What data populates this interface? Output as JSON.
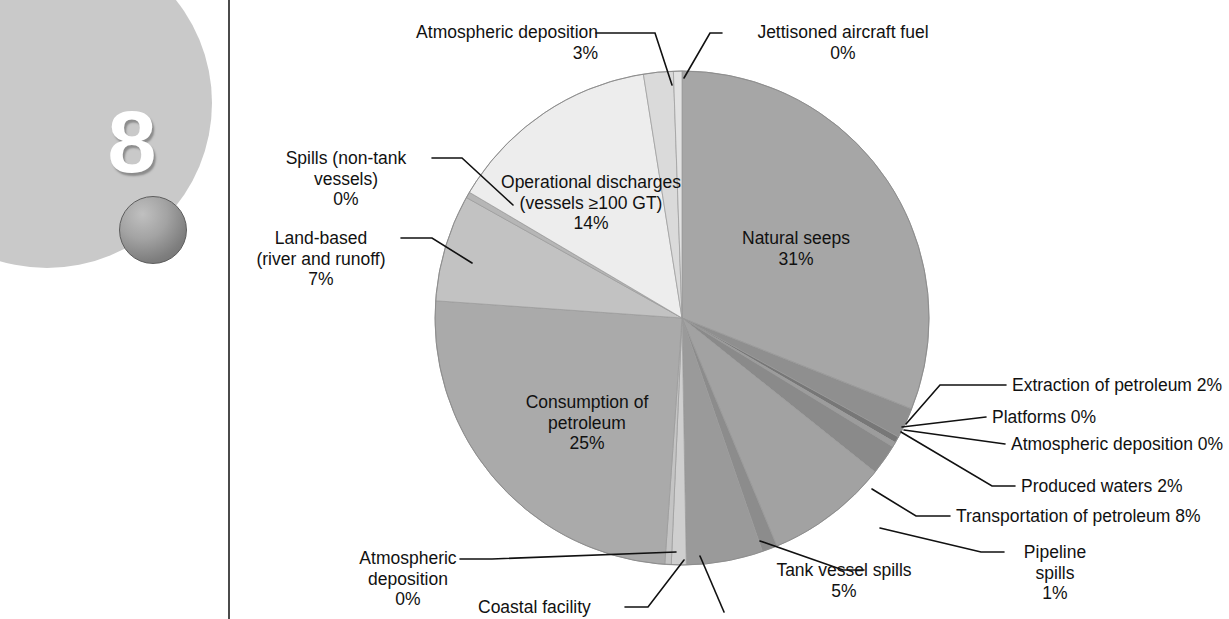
{
  "page": {
    "chapter_number": "8",
    "decoration": {
      "disc_color": "#c9c9c9",
      "ball_color": "#8e8e8e",
      "rule_color": "#4b4b4b"
    }
  },
  "chart_data": {
    "type": "pie",
    "title": "",
    "subtitle": "",
    "xlabel": "",
    "ylabel": "",
    "legend_position": "callouts",
    "grid": false,
    "units": "percent",
    "total": 100,
    "categories": [
      "Natural seeps",
      "Extraction of petroleum",
      "Platforms",
      "Atmospheric deposition (extraction)",
      "Produced waters",
      "Transportation of petroleum",
      "Pipeline spills",
      "Tank vessel spills",
      "Coastal facility spills",
      "Atmospheric deposition (transportation)",
      "Consumption of petroleum",
      "Land-based (river and runoff)",
      "Spills (non-tank vessels)",
      "Operational discharges (vessels ≥100 GT)",
      "Atmospheric deposition (consumption)",
      "Jettisoned aircraft fuel"
    ],
    "values": [
      31,
      2,
      0,
      0,
      2,
      8,
      1,
      5,
      0,
      0,
      25,
      7,
      0,
      14,
      3,
      0
    ],
    "colors": [
      "#a6a6a6",
      "#8f8f8f",
      "#777777",
      "#9c9c9c",
      "#8a8a8a",
      "#a2a2a2",
      "#8c8c8c",
      "#9a9a9a",
      "#cfcfcf",
      "#c4c4c4",
      "#aaaaaa",
      "#c2c2c2",
      "#b6b6b6",
      "#ededed",
      "#dadada",
      "#e2e2e2"
    ],
    "slices": [
      {
        "label": "Natural seeps",
        "value": 31,
        "value_text": "31%",
        "start_deg": 0,
        "end_deg": 111.6,
        "color": "#a6a6a6",
        "label_placement": "inside"
      },
      {
        "label": "Extraction of petroleum",
        "value": 2,
        "value_text": "2%",
        "start_deg": 111.6,
        "end_deg": 118.8,
        "color": "#8f8f8f",
        "label_placement": "callout"
      },
      {
        "label": "Platforms",
        "value": 0,
        "value_text": "0%",
        "start_deg": 118.8,
        "end_deg": 120.3,
        "color": "#777777",
        "label_placement": "callout"
      },
      {
        "label": "Atmospheric deposition",
        "value": 0,
        "value_text": "0%",
        "start_deg": 120.3,
        "end_deg": 121.4,
        "color": "#9c9c9c",
        "label_placement": "callout"
      },
      {
        "label": "Produced waters",
        "value": 2,
        "value_text": "2%",
        "start_deg": 121.4,
        "end_deg": 128.6,
        "color": "#8a8a8a",
        "label_placement": "callout"
      },
      {
        "label": "Transportation of petroleum",
        "value": 8,
        "value_text": "8%",
        "start_deg": 128.6,
        "end_deg": 157.4,
        "color": "#a2a2a2",
        "label_placement": "callout"
      },
      {
        "label": "Pipeline spills",
        "value": 1,
        "value_text": "1%",
        "start_deg": 157.4,
        "end_deg": 161.0,
        "color": "#8c8c8c",
        "label_placement": "callout"
      },
      {
        "label": "Tank vessel spills",
        "value": 5,
        "value_text": "5%",
        "start_deg": 161.0,
        "end_deg": 179.0,
        "color": "#9a9a9a",
        "label_placement": "callout"
      },
      {
        "label": "Coastal facility",
        "value": 0,
        "value_text": "0%",
        "start_deg": 179.0,
        "end_deg": 182.5,
        "color": "#cfcfcf",
        "label_placement": "callout"
      },
      {
        "label": "Atmospheric deposition",
        "value": 0,
        "value_text": "0%",
        "start_deg": 182.5,
        "end_deg": 184.0,
        "color": "#c4c4c4",
        "label_placement": "callout"
      },
      {
        "label": "Consumption of petroleum",
        "value": 25,
        "value_text": "25%",
        "start_deg": 184.0,
        "end_deg": 274.0,
        "color": "#aaaaaa",
        "label_placement": "inside"
      },
      {
        "label": "Land-based (river and runoff)",
        "value": 7,
        "value_text": "7%",
        "start_deg": 274.0,
        "end_deg": 299.2,
        "color": "#c2c2c2",
        "label_placement": "callout"
      },
      {
        "label": "Spills (non-tank vessels)",
        "value": 0,
        "value_text": "0%",
        "start_deg": 299.2,
        "end_deg": 300.6,
        "color": "#b6b6b6",
        "label_placement": "callout"
      },
      {
        "label": "Operational discharges (vessels ≥100 GT)",
        "value": 14,
        "value_text": "14%",
        "start_deg": 300.6,
        "end_deg": 351.0,
        "color": "#ededed",
        "label_placement": "inside"
      },
      {
        "label": "Atmospheric deposition",
        "value": 3,
        "value_text": "3%",
        "start_deg": 351.0,
        "end_deg": 358.0,
        "color": "#dadada",
        "label_placement": "callout"
      },
      {
        "label": "Jettisoned aircraft fuel",
        "value": 0,
        "value_text": "0%",
        "start_deg": 358.0,
        "end_deg": 360.0,
        "color": "#e2e2e2",
        "label_placement": "callout"
      }
    ],
    "annotations": [
      {
        "id": "atmospheric-deposition-consumption",
        "text": "Atmospheric deposition\n3%"
      },
      {
        "id": "jettisoned-aircraft-fuel",
        "text": "Jettisoned aircraft fuel\n0%"
      },
      {
        "id": "spills-non-tank-vessels",
        "text": "Spills (non-tank\nvessels)\n0%"
      },
      {
        "id": "land-based",
        "text": "Land-based\n(river and runoff)\n7%"
      },
      {
        "id": "operational-discharges",
        "text": "Operational discharges\n(vessels ≥100 GT)\n14%"
      },
      {
        "id": "natural-seeps",
        "text": "Natural seeps\n31%"
      },
      {
        "id": "consumption-of-petroleum",
        "text": "Consumption of\npetroleum\n25%"
      },
      {
        "id": "extraction-of-petroleum",
        "text": "Extraction of petroleum 2%"
      },
      {
        "id": "platforms",
        "text": "Platforms 0%"
      },
      {
        "id": "atmospheric-deposition-extraction",
        "text": "Atmospheric deposition 0%"
      },
      {
        "id": "produced-waters",
        "text": "Produced waters 2%"
      },
      {
        "id": "transportation-of-petroleum",
        "text": "Transportation of petroleum 8%"
      },
      {
        "id": "pipeline-spills",
        "text": "Pipeline\nspills\n1%"
      },
      {
        "id": "tank-vessel-spills",
        "text": "Tank vessel spills\n5%"
      },
      {
        "id": "atmospheric-deposition-transportation",
        "text": "Atmospheric\ndeposition\n0%"
      },
      {
        "id": "coastal-facility",
        "text": "Coastal facility"
      }
    ]
  },
  "labels": {
    "atmospheric_deposition_top": "Atmospheric deposition\n3%",
    "jettisoned_aircraft_fuel": "Jettisoned aircraft fuel\n0%",
    "spills_non_tank_vessels": "Spills (non-tank\nvessels)\n0%",
    "land_based": "Land-based\n(river and runoff)\n7%",
    "operational_discharges": "Operational discharges\n(vessels ≥100 GT)\n14%",
    "natural_seeps": "Natural seeps\n31%",
    "consumption_of_petroleum": "Consumption of\npetroleum\n25%",
    "extraction_of_petroleum": "Extraction of petroleum 2%",
    "platforms": "Platforms 0%",
    "atmospheric_deposition_right": "Atmospheric deposition 0%",
    "produced_waters": "Produced waters 2%",
    "transportation_of_petroleum": "Transportation of petroleum 8%",
    "pipeline_spills": "Pipeline\nspills\n1%",
    "tank_vessel_spills": "Tank vessel spills\n5%",
    "atmospheric_deposition_bottom_left": "Atmospheric\ndeposition\n0%",
    "coastal_facility": "Coastal facility"
  }
}
